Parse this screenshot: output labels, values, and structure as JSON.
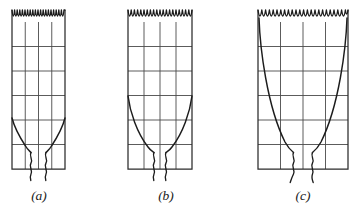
{
  "figure": {
    "background_color": "#ffffff",
    "line_color": "#1c1c1c",
    "grid_color": "#4a4a4a",
    "panels": [
      {
        "id": "a",
        "label": "(a)",
        "label_x": 39,
        "label_y": 200,
        "grid": {
          "x": 12,
          "y": 22,
          "width": 53,
          "height": 147,
          "columns": 4,
          "rows": 6
        },
        "scallop": {
          "count": 5,
          "amplitude": 12,
          "top_y": 10
        },
        "profile": {
          "neck_half_width": 5,
          "flare_half_width": 26.5,
          "flare_start_y": 118,
          "neck_y": 152,
          "description": "narrow neck with slight flare"
        },
        "break_marks": {
          "count": 2,
          "top_y": 148,
          "bottom_y": 180
        }
      },
      {
        "id": "b",
        "label": "(b)",
        "label_x": 166,
        "label_y": 200,
        "grid": {
          "x": 128,
          "y": 22,
          "width": 64,
          "height": 147,
          "columns": 4,
          "rows": 6
        },
        "scallop": {
          "count": 5,
          "amplitude": 12,
          "top_y": 10
        },
        "profile": {
          "neck_half_width": 6,
          "flare_half_width": 32,
          "flare_start_y": 96,
          "neck_y": 152,
          "description": "medium flare, parabolic"
        },
        "break_marks": {
          "count": 2,
          "top_y": 148,
          "bottom_y": 180
        }
      },
      {
        "id": "c",
        "label": "(c)",
        "label_x": 303,
        "label_y": 200,
        "grid": {
          "x": 258,
          "y": 22,
          "width": 90,
          "height": 147,
          "columns": 4,
          "rows": 6
        },
        "scallop": {
          "count": 6,
          "amplitude": 12,
          "top_y": 10
        },
        "profile": {
          "neck_half_width": 6,
          "flare_half_width": 45,
          "flare_start_y": 34,
          "neck_y": 152,
          "description": "wide flare reaching full grid width"
        },
        "break_marks": {
          "count": 2,
          "top_y": 148,
          "bottom_y": 182
        }
      }
    ]
  }
}
